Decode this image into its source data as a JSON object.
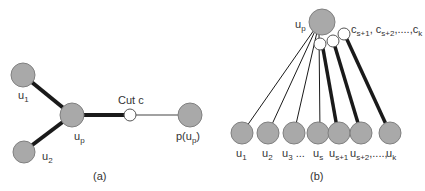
{
  "panel_a": {
    "caption": "(a)",
    "nodes": {
      "u1": {
        "label": "u",
        "sub": "1"
      },
      "u2": {
        "label": "u",
        "sub": "2"
      },
      "up": {
        "label": "u",
        "sub": "p"
      },
      "parent": {
        "label_pre": "p(u",
        "sub": "p",
        "label_post": ")"
      }
    },
    "cut_label": "Cut c"
  },
  "panel_b": {
    "caption": "(b)",
    "root": {
      "label": "u",
      "sub": "p"
    },
    "cuts_label": {
      "c1": "c",
      "s1": "s+1",
      "sep1": ", c",
      "s2": "s+2",
      "sep2": ",....,c",
      "sk": "k"
    },
    "children": [
      {
        "label": "u",
        "sub": "1",
        "suffix": ""
      },
      {
        "label": "u",
        "sub": "2",
        "suffix": ""
      },
      {
        "label": "u",
        "sub": "3",
        "suffix": " ..."
      },
      {
        "label": "u",
        "sub": "s",
        "suffix": ""
      },
      {
        "label": "u",
        "sub": "s+1",
        "suffix": ""
      },
      {
        "label": "u",
        "sub": "s+2",
        "suffix": ",....,"
      },
      {
        "label": "u",
        "sub": "k",
        "suffix": ""
      }
    ]
  },
  "colors": {
    "node_fill": "#a9a9a9",
    "node_stroke": "#808080",
    "cut_fill": "#ffffff",
    "edge": "#1a1a1a"
  }
}
